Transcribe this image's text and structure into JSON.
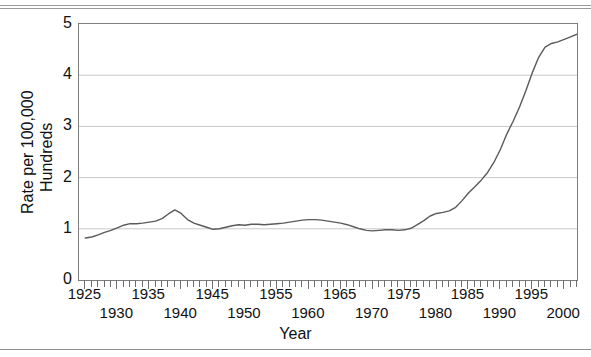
{
  "figure": {
    "rules_count": 3
  },
  "chart_data": {
    "type": "line",
    "title": "",
    "xlabel": "Year",
    "ylabel": "Rate per 100,000\nHundreds",
    "ylabel_line1": "Rate per 100,000",
    "ylabel_line2": "Hundreds",
    "xlim": [
      1924,
      2002
    ],
    "ylim": [
      0,
      5
    ],
    "grid": "horizontal",
    "legend": "none",
    "y_ticks": [
      0,
      1,
      2,
      3,
      4,
      5
    ],
    "y_tick_labels": [
      "0",
      "1",
      "2",
      "3",
      "4",
      "5"
    ],
    "x_tick_labels_upper": [
      "1925",
      "1935",
      "1945",
      "1955",
      "1965",
      "1975",
      "1985",
      "1995"
    ],
    "x_tick_labels_lower": [
      "1930",
      "1940",
      "1950",
      "1960",
      "1970",
      "1980",
      "1990",
      "2000"
    ],
    "x_minor_tick_interval": 1,
    "series": [
      {
        "name": "Rate",
        "color": "#5a5a5a",
        "x": [
          1925,
          1926,
          1927,
          1928,
          1929,
          1930,
          1931,
          1932,
          1933,
          1934,
          1935,
          1936,
          1937,
          1938,
          1939,
          1940,
          1941,
          1942,
          1943,
          1944,
          1945,
          1946,
          1947,
          1948,
          1949,
          1950,
          1951,
          1952,
          1953,
          1954,
          1955,
          1956,
          1957,
          1958,
          1959,
          1960,
          1961,
          1962,
          1963,
          1964,
          1965,
          1966,
          1967,
          1968,
          1969,
          1970,
          1971,
          1972,
          1973,
          1974,
          1975,
          1976,
          1977,
          1978,
          1979,
          1980,
          1981,
          1982,
          1983,
          1984,
          1985,
          1986,
          1987,
          1988,
          1989,
          1990,
          1991,
          1992,
          1993,
          1994,
          1995,
          1996,
          1997,
          1998,
          1999,
          2000,
          2001,
          2002
        ],
        "values": [
          0.82,
          0.84,
          0.88,
          0.93,
          0.97,
          1.02,
          1.07,
          1.1,
          1.1,
          1.11,
          1.13,
          1.15,
          1.2,
          1.29,
          1.37,
          1.3,
          1.18,
          1.11,
          1.07,
          1.03,
          0.99,
          1.0,
          1.03,
          1.06,
          1.08,
          1.07,
          1.09,
          1.09,
          1.08,
          1.09,
          1.1,
          1.11,
          1.13,
          1.15,
          1.17,
          1.18,
          1.18,
          1.17,
          1.15,
          1.13,
          1.11,
          1.08,
          1.04,
          1.0,
          0.97,
          0.96,
          0.97,
          0.98,
          0.98,
          0.97,
          0.98,
          1.01,
          1.08,
          1.16,
          1.25,
          1.3,
          1.32,
          1.35,
          1.42,
          1.55,
          1.7,
          1.82,
          1.95,
          2.1,
          2.3,
          2.55,
          2.85,
          3.1,
          3.38,
          3.7,
          4.05,
          4.35,
          4.55,
          4.62,
          4.65,
          4.7,
          4.75,
          4.8
        ]
      }
    ]
  }
}
